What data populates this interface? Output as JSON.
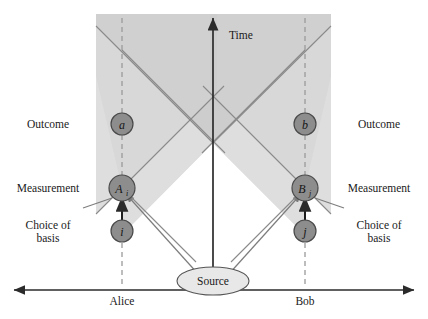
{
  "diagram": {
    "title_axis_vertical": "Time",
    "axis_left_party": "Alice",
    "axis_right_party": "Bob",
    "source_label": "Source",
    "row_labels_left": [
      "Outcome",
      "Measurement",
      "Choice of",
      "basis"
    ],
    "row_labels_right": [
      "Outcome",
      "Measurement",
      "Choice of",
      "basis"
    ],
    "nodes": [
      {
        "id": "outcome-a",
        "label": "a",
        "sub": "",
        "x": 122,
        "y": 124
      },
      {
        "id": "outcome-b",
        "label": "b",
        "sub": "",
        "x": 305,
        "y": 124
      },
      {
        "id": "measurement-a",
        "label": "A",
        "sub": "i",
        "x": 122,
        "y": 188
      },
      {
        "id": "measurement-b",
        "label": "B",
        "sub": "j",
        "x": 305,
        "y": 188
      },
      {
        "id": "basis-i",
        "label": "i",
        "sub": "",
        "x": 122,
        "y": 231
      },
      {
        "id": "basis-j",
        "label": "j",
        "sub": "",
        "x": 305,
        "y": 231
      }
    ],
    "colors": {
      "node_fill": "#8d8d8d",
      "node_stroke": "#4a4a4a",
      "cone_light": "#dcdcdc",
      "cone_dark": "#cfcfcf",
      "axis": "#2b2b2b",
      "ray": "#8a8a8a",
      "dashed": "#9a9a9a",
      "text": "#1a1a1a",
      "background": "#ffffff"
    },
    "geometry": {
      "shade_left": 96,
      "shade_right": 331,
      "shade_top": 14,
      "baseline_y": 290,
      "center_x": 213,
      "apex_y": 143,
      "alice_x": 122,
      "bob_x": 305
    }
  }
}
